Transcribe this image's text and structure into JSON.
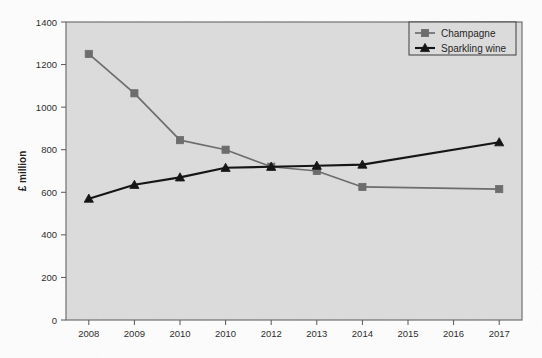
{
  "chart_data": {
    "type": "line",
    "title": "",
    "xlabel": "",
    "ylabel": "£ million",
    "ylim": [
      0,
      1400
    ],
    "ytick_step": 200,
    "yticks": [
      "0",
      "200",
      "400",
      "600",
      "800",
      "1000",
      "1200",
      "1400"
    ],
    "grid": false,
    "legend_position": "top-right",
    "categories": [
      "2008",
      "2009",
      "2010",
      "2010",
      "2012",
      "2013",
      "2014",
      "2015",
      "2016",
      "2017"
    ],
    "x": [
      "2008",
      "2009",
      "2010",
      "2010",
      "2012",
      "2013",
      "2014",
      "2015",
      "2016",
      "2017"
    ],
    "series": [
      {
        "name": "Champagne",
        "marker": "square",
        "color": "#6b6b6b",
        "values": [
          1250,
          1065,
          845,
          800,
          720,
          700,
          625,
          null,
          null,
          615
        ]
      },
      {
        "name": "Sparkling wine",
        "marker": "triangle",
        "color": "#111111",
        "values": [
          570,
          635,
          670,
          715,
          720,
          725,
          730,
          null,
          null,
          835
        ]
      }
    ]
  },
  "legend": {
    "items": [
      {
        "label": "Champagne",
        "marker": "square-marker",
        "color": "#6b6b6b"
      },
      {
        "label": "Sparkling wine",
        "marker": "triangle-marker",
        "color": "#111111"
      }
    ]
  },
  "axes": {
    "y_title": "£ million",
    "y_ticks": [
      "1400",
      "1200",
      "1000",
      "800",
      "600",
      "400",
      "200",
      "0"
    ],
    "x_ticks": [
      "2008",
      "2009",
      "2010",
      "2010",
      "2012",
      "2013",
      "2014",
      "2015",
      "2016",
      "2017"
    ]
  },
  "colors": {
    "plot_background": "#dcdcdc",
    "page_background": "#fdfdfd",
    "axis_line": "#555555",
    "champagne": "#6b6b6b",
    "sparkling": "#111111"
  }
}
